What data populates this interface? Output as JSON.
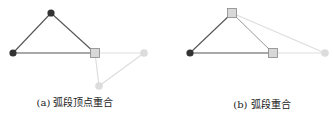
{
  "colors": {
    "edge_dark": "#555555",
    "edge_light": "#dddddd",
    "node_dark": "#333333",
    "node_light": "#dcdcdc",
    "square_fill": "#d8d8d8",
    "square_stroke": "#888888"
  },
  "figures": [
    {
      "id": "a",
      "caption": "(a) 弧段顶点重合",
      "caption_pos": [
        75,
        101
      ],
      "nodes": [
        {
          "x": 51,
          "y": 13,
          "shape": "circle",
          "style": "dark"
        },
        {
          "x": 13,
          "y": 53,
          "shape": "circle",
          "style": "dark"
        },
        {
          "x": 95,
          "y": 53,
          "shape": "square",
          "style": "shared"
        },
        {
          "x": 144,
          "y": 53,
          "shape": "circle",
          "style": "light"
        },
        {
          "x": 99,
          "y": 86,
          "shape": "circle",
          "style": "light"
        }
      ],
      "edges": [
        {
          "from": 0,
          "to": 1,
          "style": "dark"
        },
        {
          "from": 0,
          "to": 2,
          "style": "dark"
        },
        {
          "from": 1,
          "to": 2,
          "style": "dark"
        },
        {
          "from": 2,
          "to": 3,
          "style": "light"
        },
        {
          "from": 2,
          "to": 4,
          "style": "light"
        },
        {
          "from": 3,
          "to": 4,
          "style": "light"
        }
      ]
    },
    {
      "id": "b",
      "caption": "(b) 弧段重合",
      "caption_pos": [
        262,
        103
      ],
      "nodes": [
        {
          "x": 190,
          "y": 53,
          "shape": "circle",
          "style": "dark"
        },
        {
          "x": 232,
          "y": 13,
          "shape": "square",
          "style": "shared"
        },
        {
          "x": 273,
          "y": 53,
          "shape": "square",
          "style": "shared"
        },
        {
          "x": 325,
          "y": 53,
          "shape": "circle",
          "style": "light"
        }
      ],
      "edges": [
        {
          "from": 0,
          "to": 1,
          "style": "dark"
        },
        {
          "from": 0,
          "to": 2,
          "style": "dark"
        },
        {
          "from": 1,
          "to": 2,
          "style": "dark_light"
        },
        {
          "from": 1,
          "to": 3,
          "style": "light"
        },
        {
          "from": 2,
          "to": 3,
          "style": "light"
        }
      ]
    }
  ]
}
